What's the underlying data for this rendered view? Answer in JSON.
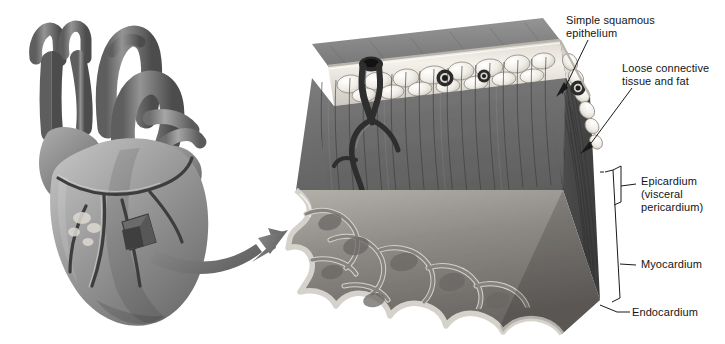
{
  "figure": {
    "background_color": "#ffffff",
    "labels": {
      "simple_squamous_epithelium": "Simple squamous\nepithelium",
      "loose_connective_tissue_and_fat": "Loose connective\ntissue and fat",
      "epicardium": "Epicardium\n(visceral\npericardium)",
      "myocardium": "Myocardium",
      "endocardium": "Endocardium"
    },
    "palette": {
      "text": "#141414",
      "leader_line": "#1a1a1a",
      "bracket": "#1a1a1a",
      "myocardium_front": "#6e6e6e",
      "myocardium_cut_face": "#4a4a4a",
      "myocardium_fiber": "#3f3f3f",
      "epicardium_band": "#e9e6e0",
      "fat_cell": "#f2efe9",
      "fat_cell_edge": "#8c8880",
      "endocardium_line": "#c9c6c0",
      "trabeculae": "#7a7a7a",
      "vessel_dark": "#2f2f2f",
      "heart_mid": "#8a8a8a",
      "heart_dark": "#5c5c5c",
      "heart_light": "#b9b9b9",
      "arrow": "#6f6f6f"
    },
    "parts": {
      "heart_overview": "whole-heart anterior view, grayscale",
      "sample_patch": "small square of heart wall excised from left ventricle",
      "magnification_arrow": "curved arrow from heart to magnified block",
      "tissue_block": "three-dimensional wedge of heart wall showing all three layers",
      "coronary_vessel": "branching coronary blood vessel entering myocardium",
      "trabeculae_carneae": "irregular muscular ridges lining the chamber"
    }
  }
}
